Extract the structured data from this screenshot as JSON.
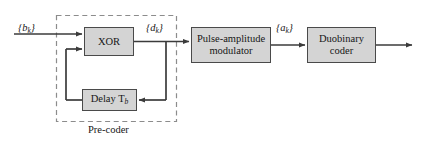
{
  "diagram": {
    "background": "#ffffff",
    "block_fill": "#d4d4d4",
    "block_stroke": "#4a4a4a",
    "line_color": "#3b3b3b",
    "dashed_color": "#8c8c8c",
    "blocks": [
      {
        "id": "xor",
        "label": "XOR"
      },
      {
        "id": "delay",
        "label": "Delay T",
        "sub": "b"
      },
      {
        "id": "pam",
        "label": "Pulse-amplitude\nmodulator"
      },
      {
        "id": "duobinary",
        "label": "Duobinary\ncoder"
      }
    ],
    "signal_labels": [
      {
        "id": "bk",
        "open": "{",
        "base": "b",
        "sub": "k",
        "close": "}"
      },
      {
        "id": "dk",
        "open": "{",
        "base": "d",
        "sub": "k",
        "close": "}"
      },
      {
        "id": "ak",
        "open": "{",
        "base": "a",
        "sub": "k",
        "close": "}"
      }
    ],
    "group_label": "Pre-coder"
  }
}
